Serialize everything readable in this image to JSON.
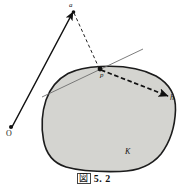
{
  "figure": {
    "caption_symbol": "図",
    "caption_number": "5. 2",
    "background_color": "#ffffff"
  },
  "colors": {
    "body_fill": "#d4d4d0",
    "body_stroke": "#1c1c1c",
    "line_stroke": "#111111",
    "tangent_stroke": "#6e6e6e",
    "label_color": "#161616"
  },
  "labels": {
    "point_a": "a",
    "point_O": "O",
    "point_p": "p",
    "vector_h": "h",
    "body_K": "K"
  },
  "geometry": {
    "convex_body_path": "M 100.5 66.5 C 120 65.5 141 68 156 76 C 169 83.5 176 95 175.5 110 C 175 126 170 142 161 154 C 152 165 138 171 120 171.5 C 100 172 80 171 66 167 C 53 163 46 154 43.5 140 C 41 126 42 112 46 100 C 50 88.5 58 79 68 73.5 C 78 68.5 89 67 100.5 66.5 Z",
    "ray_O_to_a": {
      "x1": 12,
      "y1": 127,
      "x2": 73,
      "y2": 12
    },
    "dashed_a_to_p": {
      "x1": 74,
      "y1": 13,
      "x2": 99,
      "y2": 68
    },
    "dashed_p_to_h": {
      "x1": 101,
      "y1": 70,
      "x2": 168,
      "y2": 96
    },
    "tangent_line": {
      "x1": 42,
      "y1": 97,
      "x2": 143,
      "y2": 49
    },
    "point_O_marker": {
      "cx": 11,
      "cy": 127,
      "r": 2
    },
    "point_a_marker": {
      "cx": 73.5,
      "cy": 12,
      "r": 1.8
    },
    "point_p_marker": {
      "cx": 100,
      "cy": 69,
      "r": 2.4
    }
  }
}
